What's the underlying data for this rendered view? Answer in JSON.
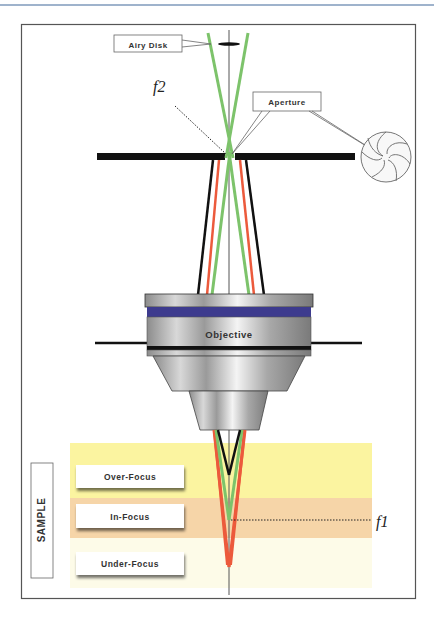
{
  "diagram": {
    "labels": {
      "airy_disk": "Airy Disk",
      "aperture": "Aperture",
      "f2": "f2",
      "objective": "Objective",
      "f1": "f1",
      "sample": "SAMPLE",
      "over_focus": "Over-Focus",
      "in_focus": "In-Focus",
      "under_focus": "Under-Focus"
    },
    "sample_letters": [
      "S",
      "A",
      "M",
      "P",
      "L",
      "E"
    ],
    "colors": {
      "frame": "#555555",
      "top_rule": "#9fb3cc",
      "green_ray": "#7dc36b",
      "red_ray": "#ec5a3c",
      "black_ray": "#111111",
      "lens_band": "#3d3b8e",
      "over_focus_band": "#fbf4a0",
      "in_focus_band": "#f6d5a8",
      "under_focus_band": "#fdfbe8"
    }
  }
}
